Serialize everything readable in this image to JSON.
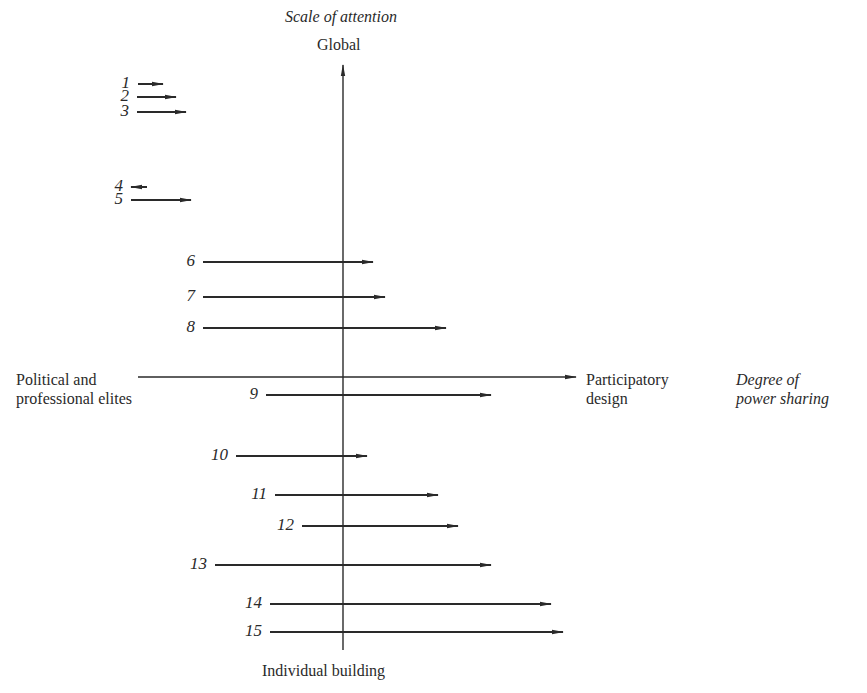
{
  "diagram": {
    "title_vertical_axis": "Scale of attention",
    "vertical_top_label": "Global",
    "vertical_bottom_label": "Individual building",
    "horizontal_left_label_line1": "Political and",
    "horizontal_left_label_line2": "professional elites",
    "horizontal_right_label_line1": "Participatory",
    "horizontal_right_label_line2": "design",
    "horizontal_axis_title_line1": "Degree of",
    "horizontal_axis_title_line2": "power sharing",
    "colors": {
      "ink": "#2a2a2a",
      "background": "#ffffff"
    },
    "axes": {
      "vertical": {
        "x": 343,
        "y_top": 65,
        "y_bottom": 650
      },
      "horizontal": {
        "y": 377,
        "x_left": 138,
        "x_right": 576
      }
    },
    "arrows": [
      {
        "label": "1",
        "x1": 138,
        "x2": 163,
        "y": 84
      },
      {
        "label": "2",
        "x1": 137,
        "x2": 176,
        "y": 97
      },
      {
        "label": "3",
        "x1": 137,
        "x2": 186,
        "y": 112
      },
      {
        "label": "4",
        "x1": 147,
        "x2": 131,
        "y": 187
      },
      {
        "label": "5",
        "x1": 131,
        "x2": 191,
        "y": 200
      },
      {
        "label": "6",
        "x1": 203,
        "x2": 373,
        "y": 262
      },
      {
        "label": "7",
        "x1": 203,
        "x2": 385,
        "y": 297
      },
      {
        "label": "8",
        "x1": 203,
        "x2": 446,
        "y": 328
      },
      {
        "label": "9",
        "x1": 266,
        "x2": 491,
        "y": 395
      },
      {
        "label": "10",
        "x1": 236,
        "x2": 367,
        "y": 456
      },
      {
        "label": "11",
        "x1": 275,
        "x2": 438,
        "y": 495
      },
      {
        "label": "12",
        "x1": 302,
        "x2": 458,
        "y": 526
      },
      {
        "label": "13",
        "x1": 215,
        "x2": 491,
        "y": 565
      },
      {
        "label": "14",
        "x1": 270,
        "x2": 551,
        "y": 604
      },
      {
        "label": "15",
        "x1": 270,
        "x2": 563,
        "y": 632
      }
    ]
  }
}
